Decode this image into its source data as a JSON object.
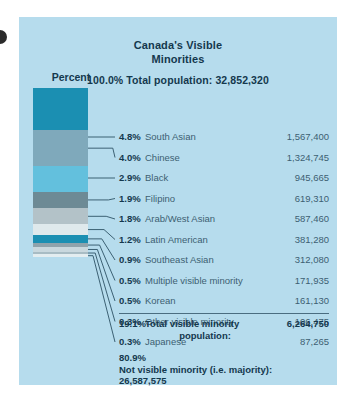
{
  "panel": {
    "background_color": "#b6dced"
  },
  "header": {
    "title_line1": "Canada's Visible",
    "title_line2": "Minorities",
    "total_population_line": "100.0% Total population: 32,852,320",
    "percent_axis_label": "Percent"
  },
  "chart_data": {
    "type": "bar",
    "title": "Canada's Visible Minorities",
    "subtitle": "100.0% Total population: 32,852,320",
    "xlabel": "",
    "ylabel": "Percent",
    "orientation": "vertical-stacked",
    "grid": false,
    "legend_position": "right-labels",
    "total_population": "32,852,320",
    "categories": [
      "South Asian",
      "Chinese",
      "Black",
      "Filipino",
      "Arab/West Asian",
      "Latin American",
      "Southeast Asian",
      "Multiple visible minority",
      "Korean",
      "Other visible minority",
      "Japanese"
    ],
    "values": [
      4.8,
      4.0,
      2.9,
      1.9,
      1.8,
      1.2,
      0.9,
      0.5,
      0.5,
      0.3,
      0.3
    ],
    "counts": [
      "1,567,400",
      "1,324,745",
      "945,665",
      "619,310",
      "587,460",
      "381,280",
      "312,080",
      "171,935",
      "161,130",
      "106,475",
      "87,265"
    ],
    "colors": [
      "#1b8fb2",
      "#7fa9bb",
      "#63c0dd",
      "#6d8a95",
      "#b3c2c8",
      "#dfe9ec",
      "#1b8fb2",
      "#8fa3ac",
      "#c9d8de",
      "#a8bcc4",
      "#e3edf0"
    ],
    "ylim": [
      0,
      19.1
    ],
    "totals": {
      "visible_minority_percent": "19.1%",
      "visible_minority_label_line1": "Total visible minority",
      "visible_minority_label_line2": "population:",
      "visible_minority_count": "6,264,750",
      "majority_percent": "80.9%",
      "majority_label": "Not visible minority (i.e. majority):",
      "majority_count": "26,587,575"
    }
  },
  "rows": [
    {
      "pct": "4.8%",
      "name": "South Asian",
      "value": "1,567,400"
    },
    {
      "pct": "4.0%",
      "name": "Chinese",
      "value": "1,324,745"
    },
    {
      "pct": "2.9%",
      "name": "Black",
      "value": "945,665"
    },
    {
      "pct": "1.9%",
      "name": "Filipino",
      "value": "619,310"
    },
    {
      "pct": "1.8%",
      "name": "Arab/West Asian",
      "value": "587,460"
    },
    {
      "pct": "1.2%",
      "name": "Latin American",
      "value": "381,280"
    },
    {
      "pct": "0.9%",
      "name": "Southeast Asian",
      "value": "312,080"
    },
    {
      "pct": "0.5%",
      "name": "Multiple visible minority",
      "value": "171,935"
    },
    {
      "pct": "0.5%",
      "name": "Korean",
      "value": "161,130"
    },
    {
      "pct": "0.3%",
      "name": "Other visible minority",
      "value": "106,475"
    },
    {
      "pct": "0.3%",
      "name": "Japanese",
      "value": "87,265"
    }
  ],
  "total_row": {
    "pct": "19.1%",
    "name_line1": "Total visible minority",
    "name_line2": "population:",
    "value": "6,264,750"
  },
  "footer": {
    "percent": "80.9%",
    "label": "Not visible minority (i.e. majority):",
    "count": "26,587,575"
  }
}
